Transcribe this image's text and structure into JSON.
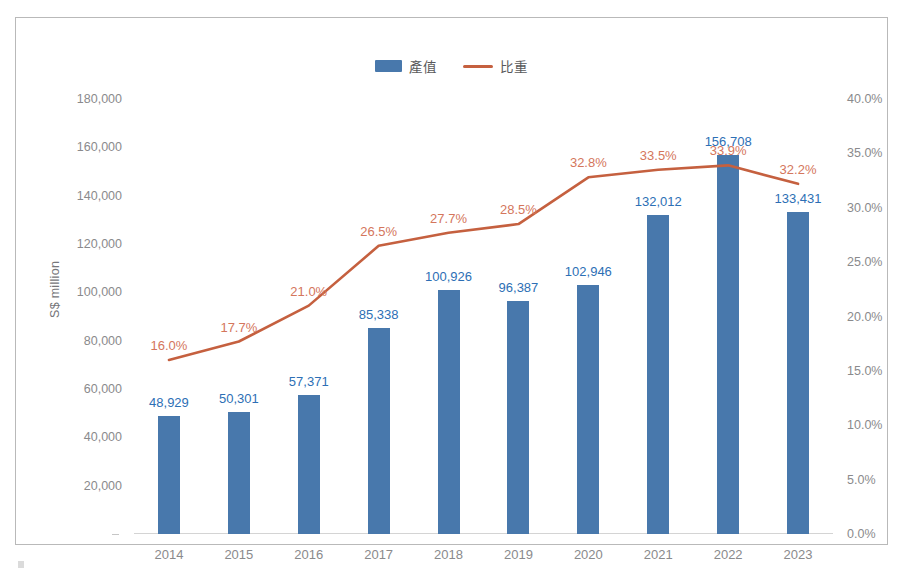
{
  "legend": {
    "entries": [
      {
        "label": "產值",
        "marker": "bar-swatch",
        "color": "#4878ac"
      },
      {
        "label": "比重",
        "marker": "line-swatch",
        "color": "#c5603f"
      }
    ]
  },
  "axes": {
    "y_left_title": "S$ million",
    "y_left_ticks": [
      "180,000",
      "160,000",
      "140,000",
      "120,000",
      "100,000",
      "80,000",
      "60,000",
      "40,000",
      "20,000"
    ],
    "y_right_ticks": [
      "40.0%",
      "35.0%",
      "30.0%",
      "25.0%",
      "20.0%",
      "15.0%",
      "10.0%",
      "5.0%",
      "0.0%"
    ]
  },
  "chart_data": {
    "type": "bar",
    "title": "",
    "subtitle": "",
    "xlabel": "",
    "ylabel": "S$ million",
    "y2label": "",
    "categories": [
      "2014",
      "2015",
      "2016",
      "2017",
      "2018",
      "2019",
      "2020",
      "2021",
      "2022",
      "2023"
    ],
    "series": [
      {
        "name": "產值",
        "type": "bar",
        "axis": "left",
        "color": "#4878ac",
        "label_color": "#2d6fb5",
        "values": [
          48929,
          50301,
          57371,
          85338,
          100926,
          96387,
          102946,
          132012,
          156708,
          133431
        ],
        "value_labels": [
          "48,929",
          "50,301",
          "57,371",
          "85,338",
          "100,926",
          "96,387",
          "102,946",
          "132,012",
          "156,708",
          "133,431"
        ]
      },
      {
        "name": "比重",
        "type": "line",
        "axis": "right",
        "color": "#c5603f",
        "label_color": "#d4765c",
        "values": [
          16.0,
          17.7,
          21.0,
          26.5,
          27.7,
          28.5,
          32.8,
          33.5,
          33.9,
          32.2
        ],
        "value_labels": [
          "16.0%",
          "17.7%",
          "21.0%",
          "26.5%",
          "27.7%",
          "28.5%",
          "32.8%",
          "33.5%",
          "33.9%",
          "32.2%"
        ]
      }
    ],
    "ylim": [
      0,
      180000
    ],
    "y2lim": [
      0,
      40
    ],
    "y_tick_step": 20000,
    "y2_tick_step": 5,
    "grid": false,
    "legend_position": "top-center"
  }
}
